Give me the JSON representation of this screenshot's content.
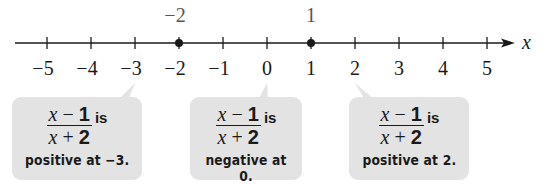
{
  "diagram": {
    "axis_label": "x",
    "ticks": [
      {
        "value": -5,
        "label": "−5",
        "x": 47
      },
      {
        "value": -4,
        "label": "−4",
        "x": 91
      },
      {
        "value": -3,
        "label": "−3",
        "x": 135
      },
      {
        "value": -2,
        "label": "−2",
        "x": 179
      },
      {
        "value": -1,
        "label": "−1",
        "x": 223
      },
      {
        "value": 0,
        "label": "0",
        "x": 267
      },
      {
        "value": 1,
        "label": "1",
        "x": 311
      },
      {
        "value": 2,
        "label": "2",
        "x": 355
      },
      {
        "value": 3,
        "label": "3",
        "x": 399
      },
      {
        "value": 4,
        "label": "4",
        "x": 443
      },
      {
        "value": 5,
        "label": "5",
        "x": 487
      }
    ],
    "critical_points": [
      {
        "value": -2,
        "label": "−2",
        "x": 179
      },
      {
        "value": 1,
        "label": "1",
        "x": 311
      }
    ],
    "colors": {
      "line": "#1a1a1a",
      "label_gray": "#555555",
      "box_fill": "#e3e3e3"
    },
    "callouts": [
      {
        "numerator_var": "x",
        "numerator_op": " − ",
        "numerator_const": "1",
        "denominator_var": "x",
        "denominator_op": " + ",
        "denominator_const": "2",
        "is": "is",
        "caption": "positive at −3.",
        "points_to": -3
      },
      {
        "numerator_var": "x",
        "numerator_op": " − ",
        "numerator_const": "1",
        "denominator_var": "x",
        "denominator_op": " + ",
        "denominator_const": "2",
        "is": "is",
        "caption": "negative at 0.",
        "points_to": 0
      },
      {
        "numerator_var": "x",
        "numerator_op": " − ",
        "numerator_const": "1",
        "denominator_var": "x",
        "denominator_op": " + ",
        "denominator_const": "2",
        "is": "is",
        "caption": "positive at 2.",
        "points_to": 2
      }
    ]
  }
}
